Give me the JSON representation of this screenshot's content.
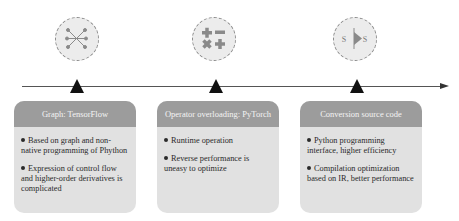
{
  "diagram": {
    "type": "timeline-comparison",
    "colors": {
      "background": "#ffffff",
      "timeline": "#555555",
      "marker": "#111111",
      "card_header": "#9c9c9c",
      "card_body": "#e1e1e1",
      "icon_circle_fill": "#ececec",
      "icon_glyph": "#8a8a8a"
    },
    "stages": [
      {
        "icon": "graph-network-icon",
        "title": "Graph: TensorFlow",
        "bullets": [
          "Based on graph and non-native programming of Phython",
          "Expression of control flow and higher-order derivatives is complicated"
        ]
      },
      {
        "icon": "math-operators-icon",
        "title": "Operator overloading: PyTorch",
        "bullets": [
          "Runtime operation",
          "Reverse performance is uneasy to optimize"
        ]
      },
      {
        "icon": "source-transform-icon",
        "title": "Conversion source code",
        "icon_labels": [
          "S",
          "S"
        ],
        "bullets": [
          "Python programming interface, higher efficiency",
          "Compilation optimization based on IR, better performance"
        ]
      }
    ]
  }
}
